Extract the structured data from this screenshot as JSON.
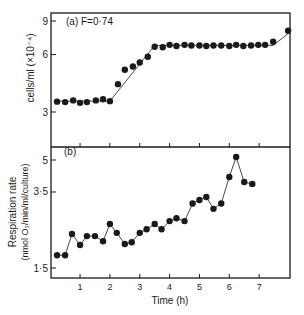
{
  "chart_data": [
    {
      "type": "scatter",
      "panel_label": "(a) F=0.74",
      "title": "",
      "xlabel": "",
      "ylabel": "cells/ml (×10⁻⁴)",
      "yscale": "log",
      "ylim": [
        2.4,
        9.8
      ],
      "yticks": [
        3,
        6,
        9
      ],
      "xlim": [
        0,
        8
      ],
      "xticks": [
        1,
        2,
        3,
        4,
        5,
        6,
        7
      ],
      "grid": false,
      "series": [
        {
          "name": "cell density",
          "marker": "filled-circle",
          "x": [
            0.23,
            0.5,
            0.77,
            1.0,
            1.23,
            1.53,
            1.77,
            2.0,
            2.27,
            2.5,
            2.77,
            3.0,
            3.27,
            3.5,
            3.77,
            4.0,
            4.23,
            4.5,
            4.73,
            5.0,
            5.23,
            5.47,
            5.73,
            6.0,
            6.23,
            6.47,
            6.73,
            6.97,
            7.2,
            7.47,
            7.97
          ],
          "y": [
            3.4,
            3.38,
            3.45,
            3.35,
            3.38,
            3.45,
            3.5,
            3.42,
            4.2,
            5.0,
            5.2,
            5.45,
            5.85,
            6.6,
            6.55,
            6.75,
            6.65,
            6.75,
            6.7,
            6.7,
            6.65,
            6.7,
            6.7,
            6.65,
            6.75,
            6.65,
            6.7,
            6.75,
            6.75,
            7.0,
            8.0
          ]
        }
      ],
      "fit_line": {
        "x": [
          0.23,
          2.0,
          3.5,
          7.47,
          8.0
        ],
        "y": [
          3.42,
          3.42,
          6.7,
          6.7,
          7.8
        ]
      }
    },
    {
      "type": "line",
      "panel_label": "(b)",
      "title": "",
      "xlabel": "Time (h)",
      "ylabel": "Respiration rate (nmol O₂/min/ml/culture)",
      "yscale": "log",
      "ylim": [
        1.35,
        5.6
      ],
      "yticks": [
        1.5,
        3.5,
        5
      ],
      "ytick_labels": [
        "1·5",
        "3·5",
        "5"
      ],
      "xlim": [
        0,
        8
      ],
      "xticks": [
        1,
        2,
        3,
        4,
        5,
        6,
        7
      ],
      "grid": false,
      "series": [
        {
          "name": "respiration rate",
          "marker": "filled-circle",
          "x": [
            0.23,
            0.5,
            0.73,
            1.0,
            1.23,
            1.5,
            1.77,
            2.0,
            2.23,
            2.5,
            2.73,
            3.0,
            3.23,
            3.5,
            3.73,
            4.0,
            4.23,
            4.5,
            4.77,
            5.0,
            5.23,
            5.47,
            5.73,
            6.0,
            6.23,
            6.5,
            6.77
          ],
          "y": [
            1.73,
            1.73,
            2.19,
            1.94,
            2.14,
            2.14,
            2.02,
            2.45,
            2.22,
            1.96,
            2.0,
            2.22,
            2.31,
            2.45,
            2.31,
            2.53,
            2.61,
            2.53,
            3.08,
            3.2,
            3.31,
            2.9,
            3.08,
            4.14,
            5.17,
            3.91,
            3.83
          ]
        }
      ]
    }
  ],
  "figure": {
    "panel_a": {
      "label": "(a)  F=0·74",
      "ylabel": "cells/ml (×10⁻⁴)",
      "ytick_labels": [
        "9",
        "6",
        "3"
      ]
    },
    "panel_b": {
      "label": "(b)",
      "ylabel_line1": "Respiration rate",
      "ylabel_line2": "(nmol O₂/min/ml/culture)",
      "ytick_labels": [
        "5",
        "3·5",
        "1·5"
      ]
    },
    "xaxis": {
      "label": "Time (h)",
      "tick_labels": [
        "1",
        "2",
        "3",
        "4",
        "5",
        "6",
        "7"
      ]
    },
    "colors": {
      "ink": "#1a1a1a",
      "line": "#333333",
      "background": "#ffffff"
    }
  }
}
